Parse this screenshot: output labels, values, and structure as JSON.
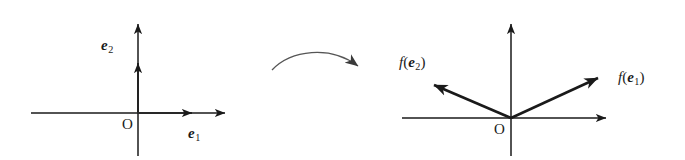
{
  "figure": {
    "kind": "linear-transformation-basis-diagram",
    "background_color": "#ffffff",
    "ink_color": "#1a1a1a",
    "curve_color": "#555555"
  },
  "left_panel": {
    "name": "domain-axes",
    "origin_label": "O",
    "x_axis_label": "e",
    "x_axis_label_sub": "1",
    "y_axis_label": "e",
    "y_axis_label_sub": "2"
  },
  "right_panel": {
    "name": "codomain-axes",
    "origin_label": "O",
    "vector1_fn": "f",
    "vector1_open": "(",
    "vector1_vec": "e",
    "vector1_sub": "1",
    "vector1_close": ")",
    "vector2_fn": "f",
    "vector2_open": "(",
    "vector2_vec": "e",
    "vector2_sub": "2",
    "vector2_close": ")"
  },
  "transform_arrow": {
    "name": "mapping-arrow",
    "label": ""
  }
}
